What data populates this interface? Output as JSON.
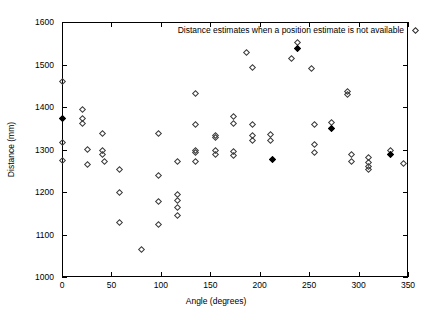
{
  "chart_data": {
    "type": "scatter",
    "title": "",
    "xlabel": "Angle (degrees)",
    "ylabel": "Distance (mm)",
    "xlim": [
      0,
      350
    ],
    "ylim": [
      1000,
      1600
    ],
    "xticks": [
      0,
      50,
      100,
      150,
      200,
      250,
      300,
      350
    ],
    "yticks": [
      1000,
      1100,
      1200,
      1300,
      1400,
      1500,
      1600
    ],
    "grid": false,
    "legend_position": "top-right",
    "marker": "diamond-open",
    "series": [
      {
        "name": "Distance estimates when a position estimate is not available",
        "points": [
          {
            "x": 0,
            "y": 1461,
            "filled": false
          },
          {
            "x": 0,
            "y": 1375,
            "filled": true
          },
          {
            "x": 0,
            "y": 1317,
            "filled": false
          },
          {
            "x": 0,
            "y": 1275,
            "filled": false
          },
          {
            "x": 20,
            "y": 1395,
            "filled": false
          },
          {
            "x": 20,
            "y": 1375,
            "filled": false
          },
          {
            "x": 20,
            "y": 1362,
            "filled": false
          },
          {
            "x": 25,
            "y": 1302,
            "filled": false
          },
          {
            "x": 25,
            "y": 1266,
            "filled": false
          },
          {
            "x": 40,
            "y": 1340,
            "filled": false
          },
          {
            "x": 40,
            "y": 1300,
            "filled": false
          },
          {
            "x": 40,
            "y": 1290,
            "filled": false
          },
          {
            "x": 42,
            "y": 1272,
            "filled": false
          },
          {
            "x": 58,
            "y": 1254,
            "filled": false
          },
          {
            "x": 58,
            "y": 1200,
            "filled": false
          },
          {
            "x": 58,
            "y": 1130,
            "filled": false
          },
          {
            "x": 80,
            "y": 1067,
            "filled": false
          },
          {
            "x": 97,
            "y": 1340,
            "filled": false
          },
          {
            "x": 97,
            "y": 1240,
            "filled": false
          },
          {
            "x": 97,
            "y": 1180,
            "filled": false
          },
          {
            "x": 97,
            "y": 1125,
            "filled": false
          },
          {
            "x": 116,
            "y": 1272,
            "filled": false
          },
          {
            "x": 116,
            "y": 1196,
            "filled": false
          },
          {
            "x": 116,
            "y": 1182,
            "filled": false
          },
          {
            "x": 116,
            "y": 1165,
            "filled": false
          },
          {
            "x": 116,
            "y": 1145,
            "filled": false
          },
          {
            "x": 135,
            "y": 1432,
            "filled": false
          },
          {
            "x": 135,
            "y": 1360,
            "filled": false
          },
          {
            "x": 135,
            "y": 1300,
            "filled": false
          },
          {
            "x": 135,
            "y": 1294,
            "filled": false
          },
          {
            "x": 135,
            "y": 1274,
            "filled": false
          },
          {
            "x": 155,
            "y": 1335,
            "filled": false
          },
          {
            "x": 155,
            "y": 1330,
            "filled": false
          },
          {
            "x": 155,
            "y": 1300,
            "filled": false
          },
          {
            "x": 155,
            "y": 1290,
            "filled": false
          },
          {
            "x": 173,
            "y": 1380,
            "filled": false
          },
          {
            "x": 173,
            "y": 1363,
            "filled": false
          },
          {
            "x": 173,
            "y": 1296,
            "filled": false
          },
          {
            "x": 173,
            "y": 1288,
            "filled": false
          },
          {
            "x": 186,
            "y": 1530,
            "filled": false
          },
          {
            "x": 192,
            "y": 1495,
            "filled": false
          },
          {
            "x": 192,
            "y": 1360,
            "filled": false
          },
          {
            "x": 192,
            "y": 1333,
            "filled": false
          },
          {
            "x": 192,
            "y": 1322,
            "filled": false
          },
          {
            "x": 210,
            "y": 1337,
            "filled": false
          },
          {
            "x": 210,
            "y": 1323,
            "filled": false
          },
          {
            "x": 212,
            "y": 1278,
            "filled": true
          },
          {
            "x": 232,
            "y": 1515,
            "filled": false
          },
          {
            "x": 238,
            "y": 1553,
            "filled": false
          },
          {
            "x": 238,
            "y": 1540,
            "filled": true
          },
          {
            "x": 252,
            "y": 1492,
            "filled": false
          },
          {
            "x": 255,
            "y": 1360,
            "filled": false
          },
          {
            "x": 255,
            "y": 1313,
            "filled": false
          },
          {
            "x": 255,
            "y": 1294,
            "filled": false
          },
          {
            "x": 272,
            "y": 1365,
            "filled": false
          },
          {
            "x": 272,
            "y": 1350,
            "filled": true
          },
          {
            "x": 288,
            "y": 1437,
            "filled": false
          },
          {
            "x": 288,
            "y": 1430,
            "filled": false
          },
          {
            "x": 292,
            "y": 1290,
            "filled": false
          },
          {
            "x": 292,
            "y": 1272,
            "filled": false
          },
          {
            "x": 310,
            "y": 1283,
            "filled": false
          },
          {
            "x": 310,
            "y": 1271,
            "filled": false
          },
          {
            "x": 310,
            "y": 1262,
            "filled": false
          },
          {
            "x": 310,
            "y": 1253,
            "filled": false
          },
          {
            "x": 332,
            "y": 1300,
            "filled": false
          },
          {
            "x": 332,
            "y": 1290,
            "filled": true
          },
          {
            "x": 345,
            "y": 1268,
            "filled": false
          }
        ]
      }
    ]
  },
  "legend": {
    "label": "Distance estimates when a position estimate is not available",
    "marker": "diamond-open-marker"
  }
}
